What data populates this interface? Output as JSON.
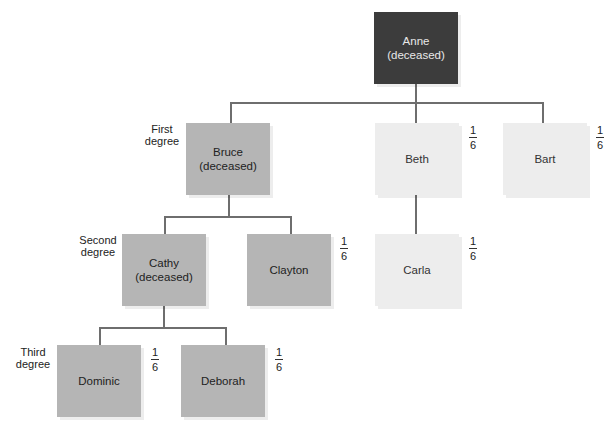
{
  "diagram": {
    "type": "family-tree",
    "colors": {
      "deceased_root": "#3c3c3c",
      "deceased": "#b5b5b5",
      "heir": "#ededed",
      "connector": "#6e6e6e"
    },
    "degree_labels": {
      "first": "First\ndegree",
      "second": "Second\ndegree",
      "third": "Third\ndegree"
    },
    "nodes": {
      "anne": {
        "label": "Anne\n(deceased)",
        "share": null
      },
      "bruce": {
        "label": "Bruce\n(deceased)",
        "share": null
      },
      "beth": {
        "label": "Beth",
        "share": {
          "num": "1",
          "den": "6"
        }
      },
      "bart": {
        "label": "Bart",
        "share": {
          "num": "1",
          "den": "6"
        }
      },
      "cathy": {
        "label": "Cathy\n(deceased)",
        "share": null
      },
      "clayton": {
        "label": "Clayton",
        "share": {
          "num": "1",
          "den": "6"
        }
      },
      "carla": {
        "label": "Carla",
        "share": {
          "num": "1",
          "den": "6"
        }
      },
      "dominic": {
        "label": "Dominic",
        "share": {
          "num": "1",
          "den": "6"
        }
      },
      "deborah": {
        "label": "Deborah",
        "share": {
          "num": "1",
          "den": "6"
        }
      }
    },
    "edges": [
      [
        "anne",
        "bruce"
      ],
      [
        "anne",
        "beth"
      ],
      [
        "anne",
        "bart"
      ],
      [
        "bruce",
        "cathy"
      ],
      [
        "bruce",
        "clayton"
      ],
      [
        "beth",
        "carla"
      ],
      [
        "cathy",
        "dominic"
      ],
      [
        "cathy",
        "deborah"
      ]
    ]
  }
}
